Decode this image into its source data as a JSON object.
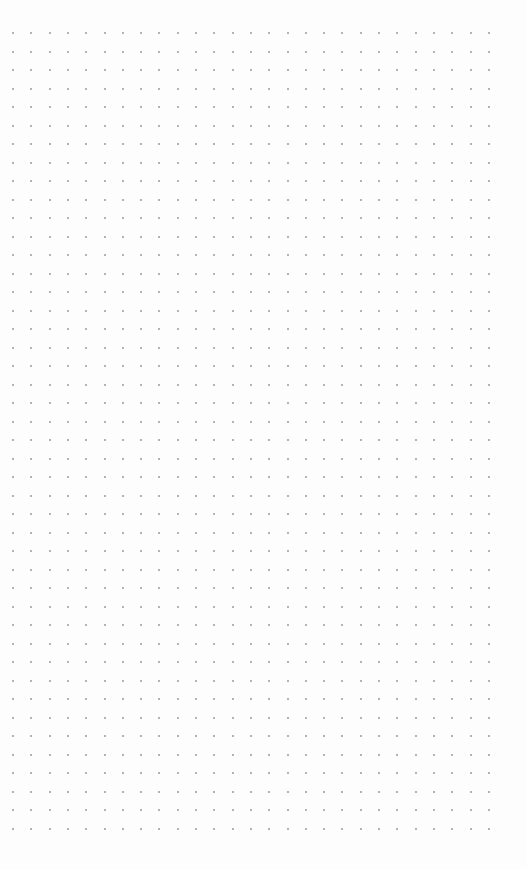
{
  "canvas": {
    "type": "dot-grid",
    "background": "#fdfdfd",
    "dot_color": "#9a9a9a",
    "columns": 27,
    "rows": 44,
    "origin_x": 13,
    "origin_y": 33,
    "spacing_x": 18.3,
    "spacing_y": 18.5
  }
}
